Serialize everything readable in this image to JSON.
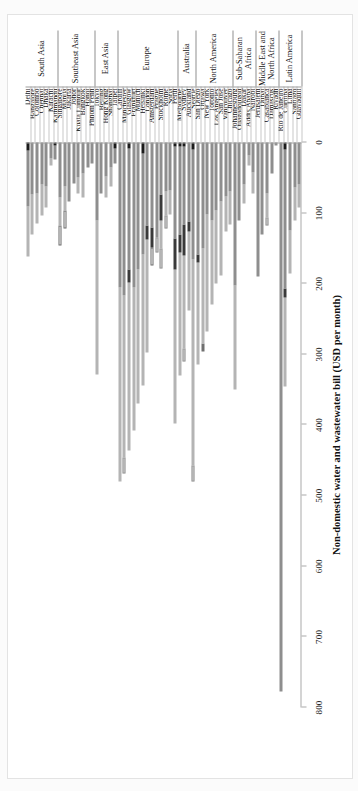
{
  "figure": {
    "orientation": "rotated-90",
    "axis_title": "Non-domestic water and wastewater bill (USD per month)"
  },
  "chart_data": {
    "type": "bar",
    "subtype": "horizontal stacked bar",
    "title": "",
    "xlabel": "",
    "ylabel": "Non-domestic water and wastewater bill (USD per month)",
    "ylim": [
      0,
      800
    ],
    "ticks": [
      0,
      100,
      200,
      300,
      400,
      500,
      600,
      700,
      800
    ],
    "grid": false,
    "legend_position": "below-plot",
    "series": [
      {
        "name": "Fixed Water Charge",
        "key": "s0",
        "color": "#1c1c1c"
      },
      {
        "name": "Variable Water Charge",
        "key": "s1",
        "color": "#8e8e8e"
      },
      {
        "name": "Fixed Wastewater Charge",
        "key": "s2",
        "color": "#3a3a3a"
      },
      {
        "name": "Variable Wastewater Charge",
        "key": "s3",
        "color": "#b4b4b4"
      },
      {
        "name": "Environmental Protection/ Conservation charge",
        "key": "s4",
        "color": "#ffffff"
      },
      {
        "name": "Stormwater/ property drainage charge",
        "key": "s5",
        "color": "#cfcfcf"
      },
      {
        "name": "Miscellaneous",
        "key": "s6",
        "color": "#6f6f6f"
      }
    ],
    "regions": [
      {
        "name": "South Asia",
        "count": 7
      },
      {
        "name": "Southeast Asia",
        "count": 8
      },
      {
        "name": "East Asia",
        "count": 5
      },
      {
        "name": "Europe",
        "count": 13
      },
      {
        "name": "Australia",
        "count": 4
      },
      {
        "name": "North America",
        "count": 8
      },
      {
        "name": "Sub-Saharan Africa",
        "count": 5
      },
      {
        "name": "Middle East and North Africa",
        "count": 5
      },
      {
        "name": "Latin America",
        "count": 5
      }
    ],
    "categories": [
      "Delhi",
      "Bangalore",
      "Colombo",
      "Chennai",
      "Dhaka",
      "Karachi",
      "Kathmandu",
      "Singapore",
      "Manila",
      "Jakarta",
      "Johor",
      "Kuala Lumpur",
      "Bangkok",
      "Hanoi",
      "Phnom Penh",
      "Tokyo",
      "Beijing",
      "Hong Kong",
      "Shanghai",
      "Taipei",
      "Cardiff",
      "Manchester",
      "Glasgow",
      "Frankfurt",
      "Munich",
      "Helsinki",
      "London",
      "Amsterdam",
      "Prague",
      "Stockholm",
      "Rome",
      "Sofia",
      "Perth",
      "Melbourne",
      "Sydney",
      "Auckland",
      "Seattle",
      "San Diego",
      "Ottawa",
      "New York",
      "Toronto",
      "Los Angeles",
      "San Jose",
      "Vancouver",
      "Chicago",
      "Johannesburg",
      "Ouagadougou",
      "Dakar",
      "Addis Ababa",
      "Nairobi",
      "Jerusalem",
      "Dubai",
      "Casablanca",
      "Damascus",
      "Riyadh",
      "Rio de Janeiro",
      "Curitiba",
      "Lima",
      "Santiago",
      "Guayaquil"
    ],
    "stacks": [
      {
        "category": "Delhi",
        "values": {
          "s0": 12,
          "s1": 78,
          "s2": 0,
          "s3": 72,
          "s4": 0,
          "s5": 0,
          "s6": 0
        }
      },
      {
        "category": "Bangalore",
        "values": {
          "s0": 0,
          "s1": 74,
          "s2": 0,
          "s3": 56,
          "s4": 0,
          "s5": 0,
          "s6": 0
        }
      },
      {
        "category": "Colombo",
        "values": {
          "s0": 0,
          "s1": 72,
          "s2": 0,
          "s3": 42,
          "s4": 0,
          "s5": 0,
          "s6": 0
        }
      },
      {
        "category": "Chennai",
        "values": {
          "s0": 0,
          "s1": 60,
          "s2": 0,
          "s3": 44,
          "s4": 0,
          "s5": 0,
          "s6": 0
        }
      },
      {
        "category": "Dhaka",
        "values": {
          "s0": 0,
          "s1": 62,
          "s2": 0,
          "s3": 30,
          "s4": 0,
          "s5": 0,
          "s6": 0
        }
      },
      {
        "category": "Karachi",
        "values": {
          "s0": 0,
          "s1": 22,
          "s2": 0,
          "s3": 10,
          "s4": 0,
          "s5": 0,
          "s6": 0
        }
      },
      {
        "category": "Kathmandu",
        "values": {
          "s0": 4,
          "s1": 20,
          "s2": 0,
          "s3": 0,
          "s4": 0,
          "s5": 0,
          "s6": 0
        }
      },
      {
        "category": "Singapore",
        "values": {
          "s0": 0,
          "s1": 78,
          "s2": 0,
          "s3": 40,
          "s4": 28,
          "s5": 0,
          "s6": 0
        }
      },
      {
        "category": "Manila",
        "values": {
          "s0": 0,
          "s1": 62,
          "s2": 0,
          "s3": 34,
          "s4": 26,
          "s5": 0,
          "s6": 0
        }
      },
      {
        "category": "Jakarta",
        "values": {
          "s0": 0,
          "s1": 84,
          "s2": 0,
          "s3": 0,
          "s4": 0,
          "s5": 0,
          "s6": 0
        }
      },
      {
        "category": "Johor",
        "values": {
          "s0": 0,
          "s1": 58,
          "s2": 0,
          "s3": 0,
          "s4": 0,
          "s5": 0,
          "s6": 0
        }
      },
      {
        "category": "Kuala Lumpur",
        "values": {
          "s0": 0,
          "s1": 50,
          "s2": 0,
          "s3": 22,
          "s4": 0,
          "s5": 0,
          "s6": 0
        }
      },
      {
        "category": "Bangkok",
        "values": {
          "s0": 0,
          "s1": 44,
          "s2": 0,
          "s3": 34,
          "s4": 0,
          "s5": 0,
          "s6": 0
        }
      },
      {
        "category": "Hanoi",
        "values": {
          "s0": 0,
          "s1": 36,
          "s2": 0,
          "s3": 0,
          "s4": 0,
          "s5": 0,
          "s6": 0
        }
      },
      {
        "category": "Phnom Penh",
        "values": {
          "s0": 0,
          "s1": 30,
          "s2": 0,
          "s3": 0,
          "s4": 0,
          "s5": 0,
          "s6": 0
        }
      },
      {
        "category": "Tokyo",
        "values": {
          "s0": 0,
          "s1": 110,
          "s2": 0,
          "s3": 218,
          "s4": 0,
          "s5": 0,
          "s6": 0
        }
      },
      {
        "category": "Beijing",
        "values": {
          "s0": 0,
          "s1": 72,
          "s2": 0,
          "s3": 0,
          "s4": 0,
          "s5": 0,
          "s6": 0
        }
      },
      {
        "category": "Hong Kong",
        "values": {
          "s0": 0,
          "s1": 48,
          "s2": 0,
          "s3": 30,
          "s4": 0,
          "s5": 0,
          "s6": 0
        }
      },
      {
        "category": "Shanghai",
        "values": {
          "s0": 0,
          "s1": 36,
          "s2": 0,
          "s3": 26,
          "s4": 0,
          "s5": 0,
          "s6": 0
        }
      },
      {
        "category": "Taipei",
        "values": {
          "s0": 8,
          "s1": 22,
          "s2": 0,
          "s3": 0,
          "s4": 0,
          "s5": 0,
          "s6": 0
        }
      },
      {
        "category": "Cardiff",
        "values": {
          "s0": 0,
          "s1": 206,
          "s2": 0,
          "s3": 274,
          "s4": 0,
          "s5": 0,
          "s6": 0
        }
      },
      {
        "category": "Manchester",
        "values": {
          "s0": 0,
          "s1": 216,
          "s2": 0,
          "s3": 230,
          "s4": 0,
          "s5": 22,
          "s6": 0
        }
      },
      {
        "category": "Glasgow",
        "values": {
          "s0": 8,
          "s1": 172,
          "s2": 18,
          "s3": 238,
          "s4": 0,
          "s5": 0,
          "s6": 0
        }
      },
      {
        "category": "Frankfurt",
        "values": {
          "s0": 0,
          "s1": 206,
          "s2": 0,
          "s3": 202,
          "s4": 0,
          "s5": 0,
          "s6": 0
        }
      },
      {
        "category": "Munich",
        "values": {
          "s0": 0,
          "s1": 180,
          "s2": 0,
          "s3": 190,
          "s4": 0,
          "s5": 0,
          "s6": 0
        }
      },
      {
        "category": "Helsinki",
        "values": {
          "s0": 16,
          "s1": 142,
          "s2": 0,
          "s3": 186,
          "s4": 0,
          "s5": 0,
          "s6": 0
        }
      },
      {
        "category": "London",
        "values": {
          "s0": 0,
          "s1": 118,
          "s2": 20,
          "s3": 160,
          "s4": 0,
          "s5": 0,
          "s6": 0
        }
      },
      {
        "category": "Amsterdam",
        "values": {
          "s0": 0,
          "s1": 120,
          "s2": 28,
          "s3": 0,
          "s4": 26,
          "s5": 0,
          "s6": 0
        }
      },
      {
        "category": "Prague",
        "values": {
          "s0": 0,
          "s1": 134,
          "s2": 0,
          "s3": 0,
          "s4": 0,
          "s5": 22,
          "s6": 0
        }
      },
      {
        "category": "Stockholm",
        "values": {
          "s0": 0,
          "s1": 74,
          "s2": 36,
          "s3": 40,
          "s4": 0,
          "s5": 28,
          "s6": 0
        }
      },
      {
        "category": "Rome",
        "values": {
          "s0": 0,
          "s1": 70,
          "s2": 0,
          "s3": 34,
          "s4": 0,
          "s5": 18,
          "s6": 0
        }
      },
      {
        "category": "Sofia",
        "values": {
          "s0": 0,
          "s1": 68,
          "s2": 0,
          "s3": 34,
          "s4": 0,
          "s5": 0,
          "s6": 0
        }
      },
      {
        "category": "Perth",
        "values": {
          "s0": 6,
          "s1": 130,
          "s2": 44,
          "s3": 218,
          "s4": 0,
          "s5": 0,
          "s6": 0
        }
      },
      {
        "category": "Melbourne",
        "values": {
          "s0": 6,
          "s1": 124,
          "s2": 26,
          "s3": 174,
          "s4": 0,
          "s5": 0,
          "s6": 0
        }
      },
      {
        "category": "Sydney",
        "values": {
          "s0": 6,
          "s1": 110,
          "s2": 44,
          "s3": 132,
          "s4": 0,
          "s5": 18,
          "s6": 0
        }
      },
      {
        "category": "Auckland",
        "values": {
          "s0": 0,
          "s1": 112,
          "s2": 14,
          "s3": 112,
          "s4": 0,
          "s5": 0,
          "s6": 0
        }
      },
      {
        "category": "Seattle",
        "values": {
          "s0": 10,
          "s1": 156,
          "s2": 0,
          "s3": 292,
          "s4": 0,
          "s5": 22,
          "s6": 0
        }
      },
      {
        "category": "San Diego",
        "values": {
          "s0": 0,
          "s1": 158,
          "s2": 12,
          "s3": 144,
          "s4": 0,
          "s5": 0,
          "s6": 0
        }
      },
      {
        "category": "Ottawa",
        "values": {
          "s0": 0,
          "s1": 150,
          "s2": 0,
          "s3": 134,
          "s4": 0,
          "s5": 0,
          "s6": 12
        }
      },
      {
        "category": "New York",
        "values": {
          "s0": 0,
          "s1": 102,
          "s2": 0,
          "s3": 166,
          "s4": 0,
          "s5": 0,
          "s6": 0
        }
      },
      {
        "category": "Toronto",
        "values": {
          "s0": 0,
          "s1": 110,
          "s2": 0,
          "s3": 120,
          "s4": 0,
          "s5": 0,
          "s6": 0
        }
      },
      {
        "category": "Los Angeles",
        "values": {
          "s0": 0,
          "s1": 96,
          "s2": 0,
          "s3": 104,
          "s4": 0,
          "s5": 0,
          "s6": 0
        }
      },
      {
        "category": "San Jose",
        "values": {
          "s0": 0,
          "s1": 84,
          "s2": 0,
          "s3": 104,
          "s4": 0,
          "s5": 0,
          "s6": 0
        }
      },
      {
        "category": "Vancouver",
        "values": {
          "s0": 0,
          "s1": 76,
          "s2": 0,
          "s3": 50,
          "s4": 0,
          "s5": 0,
          "s6": 0
        }
      },
      {
        "category": "Chicago",
        "values": {
          "s0": 0,
          "s1": 70,
          "s2": 0,
          "s3": 46,
          "s4": 0,
          "s5": 0,
          "s6": 0
        }
      },
      {
        "category": "Johannesburg",
        "values": {
          "s0": 0,
          "s1": 202,
          "s2": 0,
          "s3": 148,
          "s4": 0,
          "s5": 0,
          "s6": 0
        }
      },
      {
        "category": "Ouagadougou",
        "values": {
          "s0": 0,
          "s1": 110,
          "s2": 0,
          "s3": 0,
          "s4": 0,
          "s5": 0,
          "s6": 0
        }
      },
      {
        "category": "Dakar",
        "values": {
          "s0": 0,
          "s1": 60,
          "s2": 0,
          "s3": 26,
          "s4": 0,
          "s5": 0,
          "s6": 0
        }
      },
      {
        "category": "Addis Ababa",
        "values": {
          "s0": 0,
          "s1": 18,
          "s2": 0,
          "s3": 14,
          "s4": 0,
          "s5": 0,
          "s6": 0
        }
      },
      {
        "category": "Nairobi",
        "values": {
          "s0": 0,
          "s1": 42,
          "s2": 0,
          "s3": 30,
          "s4": 0,
          "s5": 0,
          "s6": 0
        }
      },
      {
        "category": "Jerusalem",
        "values": {
          "s0": 0,
          "s1": 190,
          "s2": 0,
          "s3": 0,
          "s4": 0,
          "s5": 0,
          "s6": 0
        }
      },
      {
        "category": "Dubai",
        "values": {
          "s0": 0,
          "s1": 130,
          "s2": 0,
          "s3": 0,
          "s4": 0,
          "s5": 0,
          "s6": 0
        }
      },
      {
        "category": "Casablanca",
        "values": {
          "s0": 0,
          "s1": 72,
          "s2": 0,
          "s3": 34,
          "s4": 0,
          "s5": 12,
          "s6": 0
        }
      },
      {
        "category": "Damascus",
        "values": {
          "s0": 0,
          "s1": 44,
          "s2": 0,
          "s3": 0,
          "s4": 0,
          "s5": 0,
          "s6": 0
        }
      },
      {
        "category": "Riyadh",
        "values": {
          "s0": 0,
          "s1": 4,
          "s2": 0,
          "s3": 0,
          "s4": 0,
          "s5": 0,
          "s6": 0
        }
      },
      {
        "category": "Rio de Janeiro",
        "values": {
          "s0": 0,
          "s1": 778,
          "s2": 0,
          "s3": 0,
          "s4": 0,
          "s5": 0,
          "s6": 0
        }
      },
      {
        "category": "Curitiba",
        "values": {
          "s0": 10,
          "s1": 196,
          "s2": 14,
          "s3": 126,
          "s4": 0,
          "s5": 0,
          "s6": 0
        }
      },
      {
        "category": "Lima",
        "values": {
          "s0": 0,
          "s1": 124,
          "s2": 0,
          "s3": 62,
          "s4": 0,
          "s5": 0,
          "s6": 0
        }
      },
      {
        "category": "Santiago",
        "values": {
          "s0": 0,
          "s1": 64,
          "s2": 0,
          "s3": 46,
          "s4": 0,
          "s5": 0,
          "s6": 0
        }
      },
      {
        "category": "Guayaquil",
        "values": {
          "s0": 0,
          "s1": 60,
          "s2": 0,
          "s3": 32,
          "s4": 0,
          "s5": 0,
          "s6": 0
        }
      }
    ]
  },
  "legend": {
    "columns": [
      {
        "items": [
          {
            "label": "Fixed Water Charge",
            "key": "s0"
          },
          {
            "label": "Environmental Protection/ Conservation charge",
            "key": "s4"
          }
        ]
      },
      {
        "items": [
          {
            "label": "Variable Water Charge",
            "key": "s1"
          },
          {
            "label": "Stormwater/ property drainage charge",
            "key": "s5"
          }
        ]
      },
      {
        "items": [
          {
            "label": "Fixed Wastewater Charge",
            "key": "s2"
          },
          {
            "label": "Miscellaneous",
            "key": "s6"
          }
        ]
      },
      {
        "items": [
          {
            "label": "Variable Wastewater Charge",
            "key": "s3"
          }
        ]
      }
    ]
  }
}
